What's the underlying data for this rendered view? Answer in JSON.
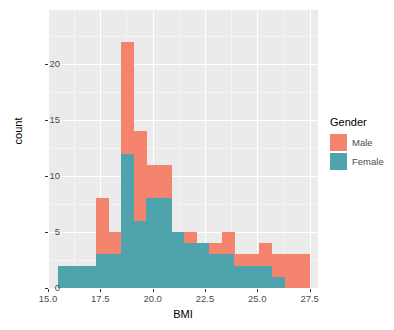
{
  "chart_data": {
    "type": "bar",
    "subtype": "stacked-histogram",
    "title": "",
    "xlabel": "BMI",
    "ylabel": "count",
    "xlim": [
      15.0,
      27.9
    ],
    "ylim": [
      0,
      22
    ],
    "xticks": [
      "15.0",
      "17.5",
      "20.0",
      "22.5",
      "25.0",
      "27.5"
    ],
    "xtick_values": [
      15.0,
      17.5,
      20.0,
      22.5,
      25.0,
      27.5
    ],
    "yticks": [
      "0",
      "5",
      "10",
      "15",
      "20"
    ],
    "ytick_values": [
      0,
      5,
      10,
      15,
      20
    ],
    "grid": true,
    "legend_position": "right",
    "binwidth": 0.6,
    "bin_starts": [
      15.5,
      16.1,
      16.7,
      17.3,
      17.9,
      18.5,
      19.1,
      19.7,
      20.3,
      20.9,
      21.5,
      22.1,
      22.7,
      23.3,
      23.9,
      24.5,
      25.1,
      25.7,
      26.3,
      26.9
    ],
    "series": [
      {
        "name": "Female",
        "color": "#4EA3AD",
        "values": [
          2,
          2,
          2,
          3,
          3,
          12,
          6,
          8,
          8,
          5,
          4,
          4,
          3,
          3,
          2,
          2,
          2,
          1,
          0,
          0
        ]
      },
      {
        "name": "Male",
        "color": "#F4846D",
        "values": [
          0,
          0,
          0,
          5,
          2,
          10,
          8,
          3,
          3,
          0,
          1,
          0,
          1,
          2,
          1,
          1,
          2,
          2,
          3,
          3
        ]
      }
    ],
    "totals": [
      2,
      2,
      2,
      8,
      5,
      22,
      14,
      11,
      11,
      5,
      5,
      4,
      4,
      5,
      3,
      3,
      4,
      3,
      3,
      3
    ]
  },
  "legend": {
    "title": "Gender",
    "items": [
      {
        "label": "Male",
        "color": "#F4846D"
      },
      {
        "label": "Female",
        "color": "#4EA3AD"
      }
    ]
  },
  "panel": {
    "background_color": "#EBEBEB",
    "gridline_color": "#FFFFFF"
  }
}
